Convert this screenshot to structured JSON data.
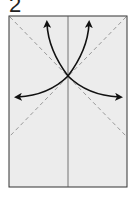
{
  "step": {
    "number": "2"
  },
  "diagram": {
    "paper": {
      "x": 9,
      "y": 16,
      "w": 118,
      "h": 171,
      "fill": "#ececec",
      "stroke": "#333333"
    },
    "center_crease": {
      "x": 68,
      "y1": 16,
      "y2": 187,
      "color": "#555555"
    },
    "dashed_diagonals": [
      {
        "x1": 10,
        "y1": 17,
        "x2": 126,
        "y2": 136
      },
      {
        "x1": 126,
        "y1": 17,
        "x2": 10,
        "y2": 136
      }
    ],
    "dash_color": "#999999",
    "arrows": [
      {
        "name": "arrow-up-left",
        "path": "M68 76 C56 60 48 44 47 22"
      },
      {
        "name": "arrow-up-right",
        "path": "M68 76 C80 60 88 44 89 22"
      },
      {
        "name": "arrow-left",
        "path": "M68 76 C54 90 36 96 18 97"
      },
      {
        "name": "arrow-right",
        "path": "M68 76 C82 90 100 96 120 97"
      }
    ],
    "arrow_color": "#111111"
  }
}
